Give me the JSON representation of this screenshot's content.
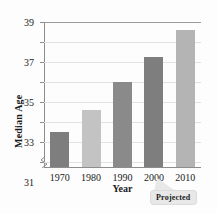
{
  "figure": {
    "top_strip_text": "",
    "callout": {
      "label": "Projected",
      "attached_to_category": "2010"
    }
  },
  "chart_data": {
    "type": "bar",
    "title": "",
    "subtitle": "",
    "xlabel": "Year",
    "ylabel": "Median Age",
    "categories": [
      "1970",
      "1980",
      "1990",
      "2000",
      "2010"
    ],
    "values": [
      27.9,
      30.1,
      32.9,
      35.4,
      38.1
    ],
    "series": [
      {
        "name": "Median Age",
        "values": [
          27.9,
          30.1,
          32.9,
          35.4,
          38.1
        ]
      }
    ],
    "ylim": [
      24.4,
      39
    ],
    "ytick_values": [
      25,
      27,
      29,
      31,
      33,
      35,
      37,
      39
    ],
    "ytick_labels": [
      "25",
      "27",
      "29",
      "31",
      "33",
      "35",
      "37",
      "39"
    ],
    "xtick_labels": [
      "1970",
      "1980",
      "1990",
      "2000",
      "2010"
    ],
    "grid": true,
    "grid_axis": "y",
    "legend": "none",
    "axis_break": true,
    "bar_colors": [
      "#7e7e7e",
      "#c3c3c3",
      "#8a8a8a",
      "#7e7e7e",
      "#b4b4b4"
    ],
    "bar_shades": [
      "dark",
      "light",
      "dark",
      "dark",
      "light"
    ],
    "annotations": [
      {
        "text": "Projected",
        "target": "2010"
      }
    ]
  },
  "colors": {
    "bar_dark": "#7e7e7e",
    "bar_light": "#c3c3c3",
    "grid": "#e2e2e2",
    "axis": "#8d8d8d",
    "text": "#1b1b1b",
    "callout_bg": "#e8e8e8",
    "background": "#fdfdfd"
  }
}
